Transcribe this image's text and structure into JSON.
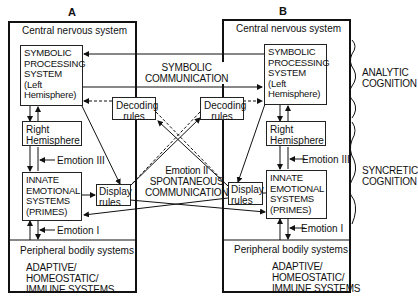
{
  "panels": {
    "a": {
      "label": "A",
      "cns_label": "Central nervous system",
      "symbolic_box": "SYMBOLIC\nPROCESSING\nSYSTEM\n(Left\nHemisphere)",
      "right_hemisphere": "Right\nHemisphere",
      "innate_box": "INNATE\nEMOTIONAL\nSYSTEMS\n(PRIMES)",
      "decoding_rules": "Decoding\nrules",
      "display_rules": "Display\nrules",
      "emotion3": "Emotion III",
      "emotion1": "Emotion I",
      "peripheral_label": "Peripheral bodily systems",
      "adaptive": "ADAPTIVE/\nHOMEOSTATIC/\nIMMUNE SYSTEMS"
    },
    "b": {
      "label": "B",
      "cns_label": "Central nervous system",
      "symbolic_box": "SYMBOLIC\nPROCESSING\nSYSTEM\n(Left\nHemisphere)",
      "right_hemisphere": "Right\nHemisphere",
      "innate_box": "INNATE\nEMOTIONAL\nSYSTEMS\n(PRIMES)",
      "decoding_rules": "Decoding\nrules",
      "display_rules": "Display\nrules",
      "emotion3": "Emotion III",
      "emotion1": "Emotion I",
      "peripheral_label": "Peripheral bodily systems",
      "adaptive": "ADAPTIVE/\nHOMEOSTATIC/\nIMMUNE SYSTEMS"
    }
  },
  "center": {
    "symbolic_communication": "SYMBOLIC\nCOMMUNICATION",
    "emotion2": "Emotion II\nSPONTANEOUS\nCOMMUNICATION"
  },
  "brackets": {
    "analytic": "ANALYTIC\nCOGNITION",
    "syncretic": "SYNCRETIC\nCOGNITION"
  }
}
